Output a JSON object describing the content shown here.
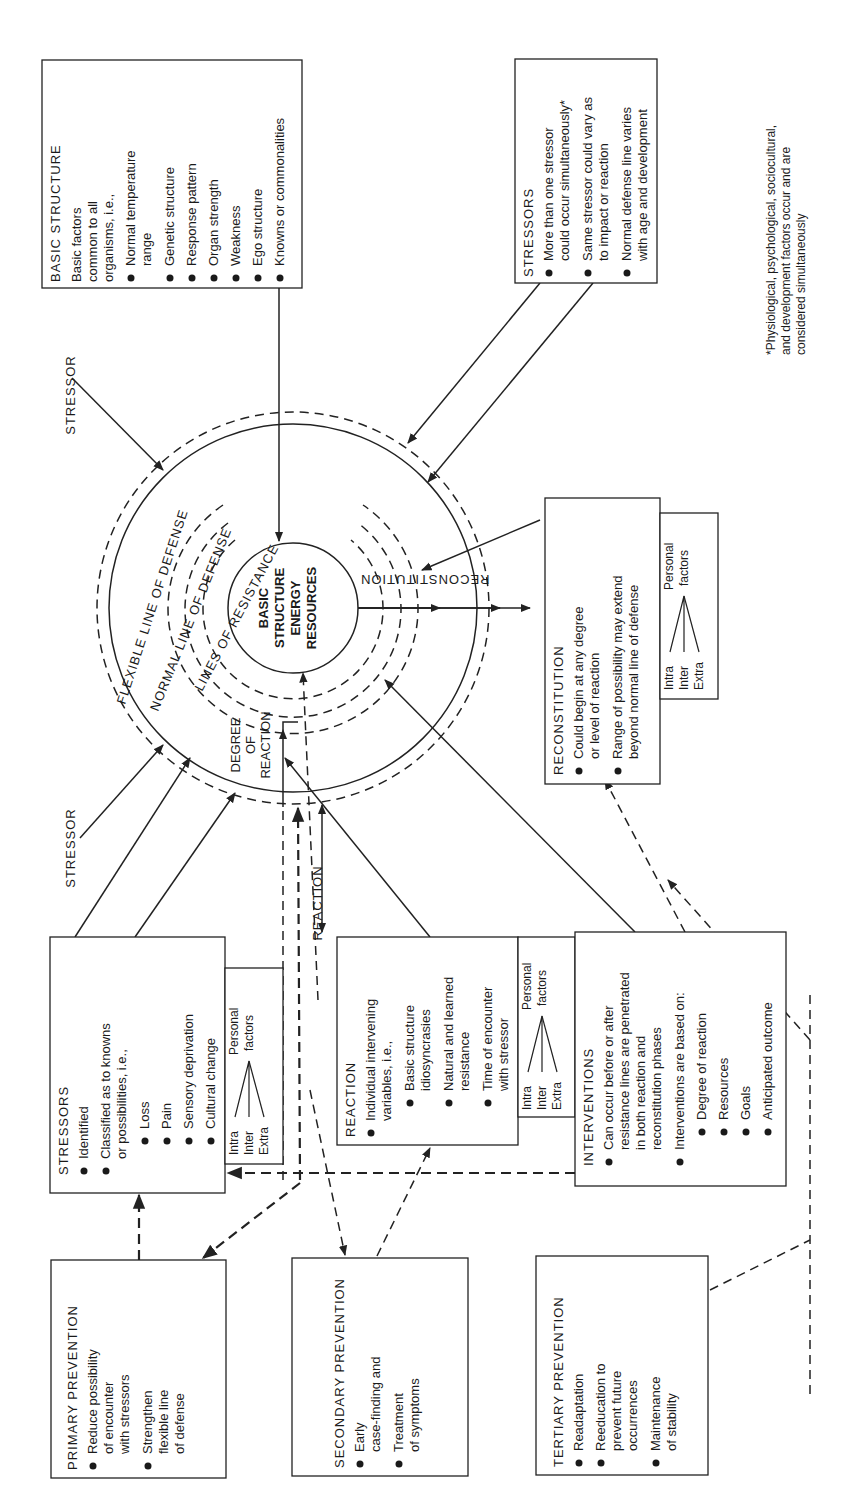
{
  "diagram": {
    "core": {
      "lines": [
        "BASIC",
        "STRUCTURE",
        "ENERGY",
        "RESOURCES"
      ]
    },
    "ring_labels": {
      "flexible": "FLEXIBLE LINE OF DEFENSE",
      "normal": "NORMAL LINE OF DEFENSE",
      "resistance": "LINES OF RESISTANCE",
      "reconstitution": "RECONSTITUTION",
      "degree_of_reaction": [
        "DEGREE",
        "OF",
        "REACTION"
      ],
      "reaction": "REACTION"
    },
    "stressor_labels": {
      "top": "STRESSOR",
      "bottom": "STRESSOR"
    },
    "basic_structure_box": {
      "title": "BASIC STRUCTURE",
      "intro": [
        "Basic factors",
        "common to all",
        "organisms, i.e.,"
      ],
      "bullets": [
        [
          "Normal temperature",
          "range"
        ],
        [
          "Genetic structure"
        ],
        [
          "Response pattern"
        ],
        [
          "Organ strength"
        ],
        [
          "Weakness"
        ],
        [
          "Ego structure"
        ],
        [
          "Knowns or commonalities"
        ]
      ]
    },
    "stressors_top_box": {
      "title": "STRESSORS",
      "bullets": [
        [
          "More than one stressor",
          "could occur simultaneously*"
        ],
        [
          "Same stressor could vary as",
          "to impact or reaction"
        ],
        [
          "Normal defense line varies",
          "with age and development"
        ]
      ]
    },
    "footnote": [
      "*Physiological, psychological, sociocultural,",
      "and development factors occur and are",
      "considered simultaneously"
    ],
    "reconstitution_box": {
      "title": "RECONSTITUTION",
      "bullets": [
        [
          "Could begin at any degree",
          "or level of reaction"
        ],
        [
          "Range of possibility may extend",
          "beyond normal line of defense"
        ]
      ]
    },
    "personal_factors": {
      "label": [
        "Personal",
        "factors"
      ],
      "items": [
        "Intra",
        "Inter",
        "Extra"
      ]
    },
    "stressors_left_box": {
      "title": "STRESSORS",
      "bullets": [
        [
          "Identified"
        ],
        [
          "Classified as to knowns",
          "or possibilities, i.e.,"
        ]
      ],
      "sub_bullets": [
        "Loss",
        "Pain",
        "Sensory deprivation",
        "Cultural change"
      ]
    },
    "reaction_box": {
      "title": "REACTION",
      "bullets": [
        [
          "Individual intervening",
          "variables, i.e.,"
        ]
      ],
      "sub_bullets": [
        [
          "Basic structure",
          "idiosyncrasies"
        ],
        [
          "Natural and learned",
          "resistance"
        ],
        [
          "Time of encounter",
          "with stressor"
        ]
      ]
    },
    "interventions_box": {
      "title": "INTERVENTIONS",
      "bullets": [
        [
          "Can occur before or after",
          "resistance lines are penetrated",
          "in both reaction and",
          "reconstitution phases"
        ],
        [
          "Interventions are based on:"
        ]
      ],
      "sub_bullets": [
        "Degree of reaction",
        "Resources",
        "Goals",
        "Anticipated outcome"
      ]
    },
    "primary_prevention_box": {
      "title": "PRIMARY PREVENTION",
      "bullets": [
        [
          "Reduce possibility",
          "of encounter",
          "with stressors"
        ],
        [
          "Strengthen",
          "flexible line",
          "of defense"
        ]
      ]
    },
    "secondary_prevention_box": {
      "title": "SECONDARY PREVENTION",
      "bullets": [
        [
          "Early",
          "case-finding and"
        ],
        [
          "Treatment",
          "of symptoms"
        ]
      ]
    },
    "tertiary_prevention_box": {
      "title": "TERTIARY PREVENTION",
      "bullets": [
        [
          "Readaptation"
        ],
        [
          "Reeducation to",
          "prevent future",
          "occurrences"
        ],
        [
          "Maintenance",
          "of stability"
        ]
      ]
    }
  }
}
